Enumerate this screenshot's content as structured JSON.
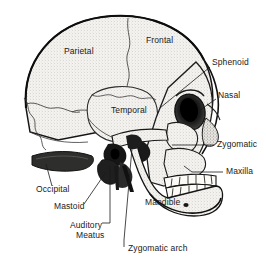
{
  "figure": {
    "view": "lateral",
    "style": "stippled pen-and-ink anatomical illustration",
    "background_color": "#ffffff",
    "ink_color": "#1a1a1a",
    "bone_fill": "#f2f0ec",
    "shadow_fill": "#2b2b2b",
    "width": 266,
    "height": 265
  },
  "labels": [
    {
      "id": "parietal",
      "text": "Parietal",
      "x": 64,
      "y": 52,
      "leader": false
    },
    {
      "id": "frontal",
      "text": "Frontal",
      "x": 146,
      "y": 41,
      "leader": false
    },
    {
      "id": "temporal",
      "text": "Temporal",
      "x": 111,
      "y": 111,
      "leader": false
    },
    {
      "id": "mandible",
      "text": "Mandible",
      "x": 145,
      "y": 203,
      "leader": false
    },
    {
      "id": "sphenoid",
      "text": "Sphenoid",
      "x": 212,
      "y": 63,
      "leader": true
    },
    {
      "id": "nasal",
      "text": "Nasal",
      "x": 218,
      "y": 96,
      "leader": true
    },
    {
      "id": "zygomatic",
      "text": "Zygomatic",
      "x": 217,
      "y": 145,
      "leader": true
    },
    {
      "id": "maxilla",
      "text": "Maxilla",
      "x": 226,
      "y": 172,
      "leader": true
    },
    {
      "id": "occipital",
      "text": "Occipital",
      "x": 36,
      "y": 190,
      "leader": true
    },
    {
      "id": "mastoid",
      "text": "Mastoid",
      "x": 54,
      "y": 207,
      "leader": true
    },
    {
      "id": "auditory-meatus",
      "text": "Auditory",
      "x": 70,
      "y": 226,
      "leader": true
    },
    {
      "id": "auditory-meatus-2",
      "text": "Meatus",
      "x": 76,
      "y": 236,
      "leader": false
    },
    {
      "id": "zygomatic-arch",
      "text": "Zygomatic arch",
      "x": 128,
      "y": 249,
      "leader": true
    }
  ],
  "anatomy_regions": [
    "cranial vault",
    "coronal suture",
    "squamosal suture",
    "lambdoid suture",
    "orbit",
    "nasal aperture",
    "zygomatic arch",
    "external auditory meatus",
    "mastoid process",
    "maxillary teeth",
    "mandibular teeth",
    "mental foramen"
  ]
}
